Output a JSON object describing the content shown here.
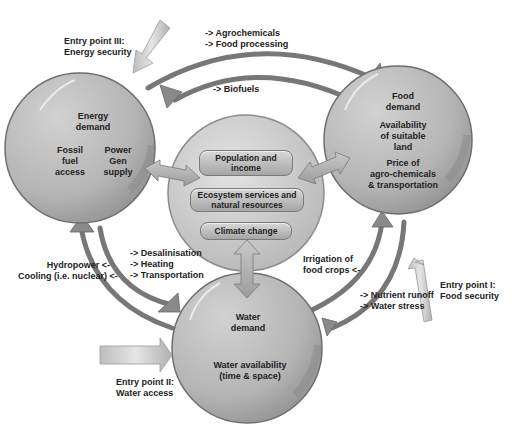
{
  "diagram": {
    "colors": {
      "circle_fill_light": "#c8c8c8",
      "circle_fill_dark": "#9a9a9a",
      "circle_stroke": "#6e6e6e",
      "arrow_stroke": "#7a7a7a",
      "entry_arrow": "#c4c4c4",
      "text": "#222222"
    },
    "nodes": {
      "energy": {
        "title": "Energy\ndemand",
        "left_item": "Fossil\nfuel\naccess",
        "right_item": "Power\nGen\nsupply"
      },
      "food": {
        "title": "Food\ndemand",
        "item1": "Availability\nof suitable\nland",
        "item2": "Price of\nagro-chemicals\n& transportation"
      },
      "water": {
        "title": "Water\ndemand",
        "item1": "Water availability\n(time & space)"
      },
      "center": {
        "boxes": [
          "Population and\nincome",
          "Ecosystem services and\nnatural resources",
          "Climate change"
        ]
      }
    },
    "entry_points": [
      {
        "id": "entry-3",
        "label": "Entry point III:\nEnergy security"
      },
      {
        "id": "entry-1",
        "label": "Entry point I:\nFood security"
      },
      {
        "id": "entry-2",
        "label": "Entry point II:\nWater access"
      }
    ],
    "flows": {
      "energy_to_food": "-> Agrochemicals\n-> Food processing",
      "food_to_energy": "-> Biofuels",
      "energy_to_water": "-> Desalinisation\n-> Heating\n-> Transportation",
      "water_to_energy": "Hydropower <-\nCooling (i.e. nuclear) <-",
      "water_to_food": "Irrigation of\nfood crops <-",
      "food_to_water": "-> Nutrient runoff\n-> Water stress"
    }
  }
}
